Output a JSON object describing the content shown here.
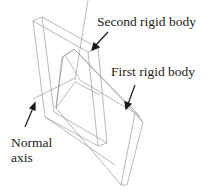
{
  "figure": {
    "labels": {
      "second_rigid_body": "Second rigid body",
      "first_rigid_body": "First rigid body",
      "normal_axis_line1": "Normal",
      "normal_axis_line2": "axis"
    },
    "colors": {
      "wireframe": "#8a8a8a",
      "arrow": "#1a1a1a",
      "text": "#222222",
      "background": "#ffffff"
    }
  }
}
